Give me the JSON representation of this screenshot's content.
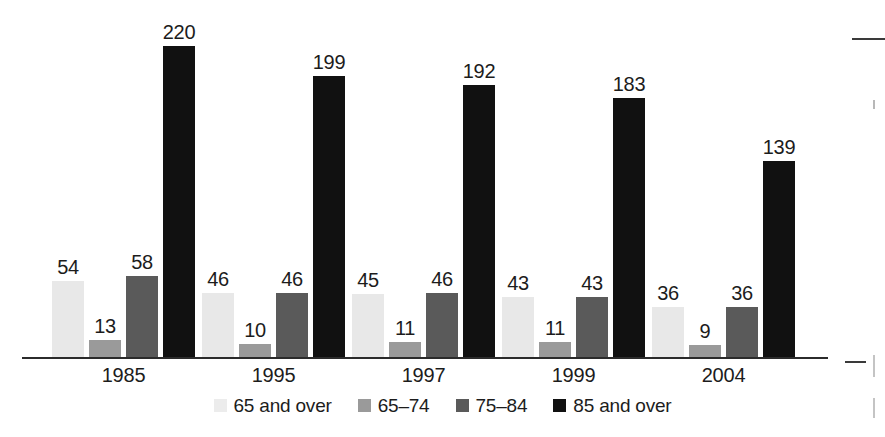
{
  "chart_data": {
    "type": "bar",
    "title": "",
    "subtitle": "",
    "xlabel": "",
    "ylabel": "",
    "categories": [
      "1985",
      "1995",
      "1997",
      "1999",
      "2004"
    ],
    "series": [
      {
        "name": "65 and over",
        "color": "#ececec",
        "values": [
          54,
          46,
          45,
          43,
          36
        ]
      },
      {
        "name": "65–74",
        "color": "#9a9a9a",
        "values": [
          13,
          10,
          11,
          11,
          9
        ]
      },
      {
        "name": "75–84",
        "color": "#5a5a5a",
        "values": [
          58,
          46,
          46,
          43,
          36
        ]
      },
      {
        "name": "85 and over",
        "color": "#111111",
        "values": [
          220,
          199,
          192,
          183,
          139
        ]
      }
    ],
    "ylim": [
      0,
      248
    ],
    "grid": false,
    "data_labels": true,
    "legend_position": "bottom",
    "axis_line_color": "#2b2b2b"
  },
  "legend": {
    "items": [
      {
        "label": "65 and over",
        "swatch": "legend-swatch-65-and-over"
      },
      {
        "label": "65–74",
        "swatch": "legend-swatch-65-74"
      },
      {
        "label": "75–84",
        "swatch": "legend-swatch-75-84"
      },
      {
        "label": "85 and over",
        "swatch": "legend-swatch-85-and-over"
      }
    ]
  }
}
